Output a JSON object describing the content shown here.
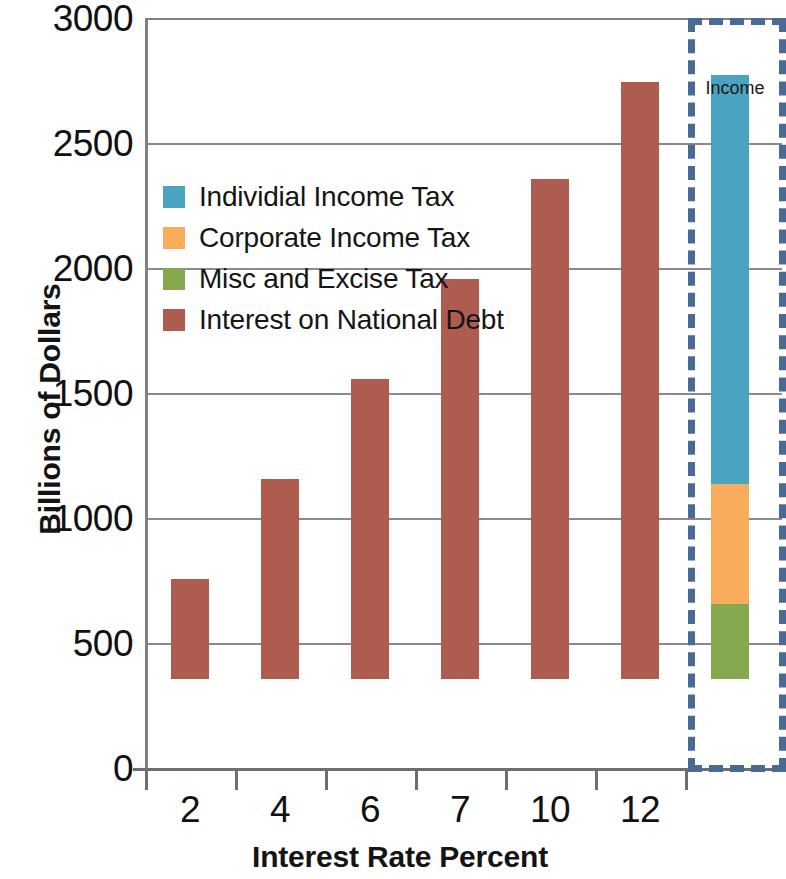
{
  "chart_data": {
    "type": "bar",
    "title": "",
    "xlabel": "Interest Rate Percent",
    "ylabel": "Billions of Dollars",
    "ylim": [
      0,
      3000
    ],
    "ytick_values": [
      0,
      500,
      1000,
      1500,
      2000,
      2500,
      3000
    ],
    "ytick_labels": [
      "0",
      "500",
      "1000",
      "1500",
      "2000",
      "2500",
      "3000"
    ],
    "grid": true,
    "legend_position": "inside-upper-left",
    "categories": [
      "2",
      "4",
      "6",
      "7",
      "10",
      "12",
      "Income"
    ],
    "series": [
      {
        "name": "Individial Income Tax",
        "color": "#4aa3c1",
        "values": [
          0,
          0,
          0,
          0,
          0,
          0,
          1635
        ]
      },
      {
        "name": "Corporate Income Tax",
        "color": "#f9ac5b",
        "values": [
          0,
          0,
          0,
          0,
          0,
          0,
          480
        ]
      },
      {
        "name": "Misc and Excise Tax",
        "color": "#86a84e",
        "values": [
          0,
          0,
          0,
          0,
          0,
          0,
          300
        ]
      },
      {
        "name": "Interest on National Debt",
        "color": "#ad5c4f",
        "values": [
          400,
          800,
          1200,
          1600,
          2000,
          2390,
          0
        ]
      }
    ],
    "bars": [
      {
        "category": "2",
        "total": 400,
        "segments": [
          {
            "series": "Interest on National Debt",
            "value": 400
          }
        ]
      },
      {
        "category": "4",
        "total": 800,
        "segments": [
          {
            "series": "Interest on National Debt",
            "value": 800
          }
        ]
      },
      {
        "category": "6",
        "total": 1200,
        "segments": [
          {
            "series": "Interest on National Debt",
            "value": 1200
          }
        ]
      },
      {
        "category": "7",
        "total": 1600,
        "segments": [
          {
            "series": "Interest on National Debt",
            "value": 1600
          }
        ]
      },
      {
        "category": "10",
        "total": 2000,
        "segments": [
          {
            "series": "Interest on National Debt",
            "value": 2000
          }
        ]
      },
      {
        "category": "12",
        "total": 2390,
        "segments": [
          {
            "series": "Interest on National Debt",
            "value": 2390
          }
        ]
      },
      {
        "category": "Income",
        "total": 2415,
        "segments": [
          {
            "series": "Misc and Excise Tax",
            "value": 300
          },
          {
            "series": "Corporate Income Tax",
            "value": 480
          },
          {
            "series": "Individial Income Tax",
            "value": 1635
          }
        ]
      }
    ],
    "annotations": [
      {
        "text": "Income",
        "style": "dashed-box",
        "color": "#4a6a96"
      }
    ]
  },
  "axes": {
    "y_title": "Billions of Dollars",
    "x_title": "Interest Rate Percent",
    "y_ticks": [
      "3000",
      "2500",
      "2000",
      "1500",
      "1000",
      "500",
      "0"
    ],
    "x_ticks": [
      "2",
      "4",
      "6",
      "7",
      "10",
      "12"
    ]
  },
  "legend": {
    "items": [
      {
        "label": "Individial Income Tax",
        "color": "#4aa3c1"
      },
      {
        "label": "Corporate Income Tax",
        "color": "#f9ac5b"
      },
      {
        "label": "Misc and Excise Tax",
        "color": "#86a84e"
      },
      {
        "label": "Interest on National Debt",
        "color": "#ad5c4f"
      }
    ]
  },
  "callout": {
    "label": "Income",
    "color": "#4a6a96"
  },
  "colors": {
    "individual_income_tax": "#4aa3c1",
    "corporate_income_tax": "#f9ac5b",
    "misc_and_excise_tax": "#86a84e",
    "interest_on_national_debt": "#ad5c4f",
    "callout_border": "#4a6a96",
    "gridline": "#8a8a8a",
    "axis": "#6e6e6e",
    "background": "#ffffff",
    "text": "#141414"
  }
}
